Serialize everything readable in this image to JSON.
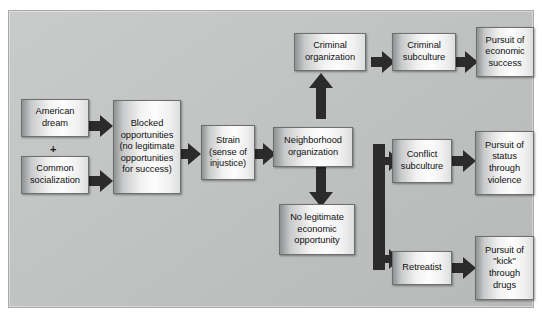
{
  "diagram": {
    "canvas": {
      "background": "#c3c5c5",
      "border_color": "#a9abab"
    },
    "arrow_color": "#2b2b2b",
    "box_border_color": "#6e7070",
    "connector_symbol": "+",
    "nodes": [
      {
        "id": "american-dream",
        "label": "American\ndream"
      },
      {
        "id": "common-socialization",
        "label": "Common\nsocialization"
      },
      {
        "id": "blocked-opportunities",
        "label": "Blocked\nopportunities\n(no legitimate\nopportunities\nfor success)"
      },
      {
        "id": "strain",
        "label": "Strain\n(sense of\ninjustice)"
      },
      {
        "id": "neighborhood-organization",
        "label": "Neighborhood\norganization"
      },
      {
        "id": "criminal-organization",
        "label": "Criminal\norganization"
      },
      {
        "id": "criminal-subculture",
        "label": "Criminal\nsubculture"
      },
      {
        "id": "pursuit-economic-success",
        "label": "Pursuit of\neconomic\nsuccess"
      },
      {
        "id": "no-legitimate-economic-opportunity",
        "label": "No legitimate\neconomic\nopportunity"
      },
      {
        "id": "conflict-subculture",
        "label": "Conflict\nsubculture"
      },
      {
        "id": "pursuit-status-violence",
        "label": "Pursuit of\nstatus\nthrough\nviolence"
      },
      {
        "id": "retreatist",
        "label": "Retreatist"
      },
      {
        "id": "pursuit-kick-drugs",
        "label": "Pursuit of\n\"kick\"\nthrough\ndrugs"
      }
    ],
    "edges": [
      {
        "from": "american-dream",
        "to": "blocked-opportunities",
        "direction": "right"
      },
      {
        "from": "common-socialization",
        "to": "blocked-opportunities",
        "direction": "right"
      },
      {
        "from": "blocked-opportunities",
        "to": "strain",
        "direction": "right"
      },
      {
        "from": "strain",
        "to": "neighborhood-organization",
        "direction": "right"
      },
      {
        "from": "neighborhood-organization",
        "to": "criminal-organization",
        "direction": "up"
      },
      {
        "from": "neighborhood-organization",
        "to": "no-legitimate-economic-opportunity",
        "direction": "down"
      },
      {
        "from": "criminal-organization",
        "to": "criminal-subculture",
        "direction": "right"
      },
      {
        "from": "criminal-subculture",
        "to": "pursuit-economic-success",
        "direction": "right"
      },
      {
        "from": "no-legitimate-economic-opportunity",
        "to": "conflict-subculture",
        "direction": "branch-up-right"
      },
      {
        "from": "no-legitimate-economic-opportunity",
        "to": "retreatist",
        "direction": "branch-down-right"
      },
      {
        "from": "conflict-subculture",
        "to": "pursuit-status-violence",
        "direction": "right"
      },
      {
        "from": "retreatist",
        "to": "pursuit-kick-drugs",
        "direction": "right"
      }
    ]
  }
}
